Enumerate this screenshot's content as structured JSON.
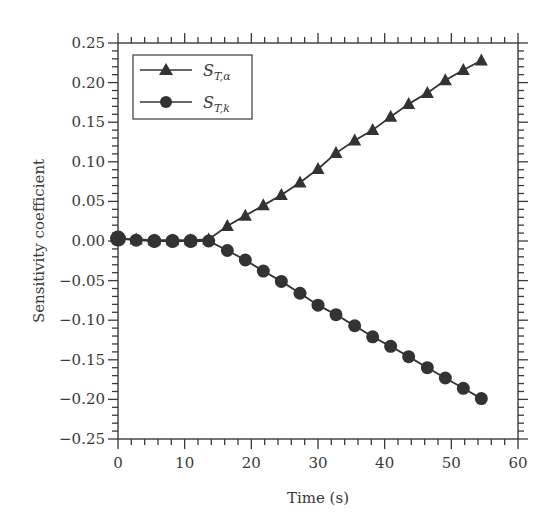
{
  "chart_data": {
    "type": "line",
    "title": "",
    "xlabel": "Time (s)",
    "ylabel": "Sensitivity coefficient",
    "xlim": [
      0,
      60
    ],
    "ylim": [
      -0.25,
      0.25
    ],
    "xticks": [
      0,
      10,
      20,
      30,
      40,
      50,
      60
    ],
    "xtick_labels": [
      "0",
      "10",
      "20",
      "30",
      "40",
      "50",
      "60"
    ],
    "yticks": [
      -0.25,
      -0.2,
      -0.15,
      -0.1,
      -0.05,
      0.0,
      0.05,
      0.1,
      0.15,
      0.2,
      0.25
    ],
    "ytick_labels": [
      "−0.25",
      "−0.20",
      "−0.15",
      "−0.10",
      "−0.05",
      "0.00",
      "0.05",
      "0.10",
      "0.15",
      "0.20",
      "0.25"
    ],
    "grid": false,
    "legend_position": "upper left",
    "x": [
      0,
      2.73,
      5.45,
      8.18,
      10.9,
      13.6,
      16.4,
      19.1,
      21.8,
      24.5,
      27.3,
      30.0,
      32.7,
      35.5,
      38.2,
      40.9,
      43.6,
      46.4,
      49.1,
      51.8,
      54.5
    ],
    "series": [
      {
        "name": "S_{T,α}",
        "label_main": "S",
        "label_sub": "T,α",
        "marker": "triangle",
        "color": "#333333",
        "values": [
          0.003,
          0.002,
          0.001,
          0.001,
          0.001,
          0.002,
          0.019,
          0.032,
          0.045,
          0.058,
          0.074,
          0.091,
          0.111,
          0.127,
          0.14,
          0.157,
          0.173,
          0.187,
          0.203,
          0.216,
          0.228
        ]
      },
      {
        "name": "S_{T,k}",
        "label_main": "S",
        "label_sub": "T,k",
        "marker": "circle",
        "color": "#333333",
        "values": [
          0.003,
          0.001,
          0.0,
          0.0,
          0.0,
          0.0,
          -0.012,
          -0.024,
          -0.038,
          -0.051,
          -0.066,
          -0.081,
          -0.093,
          -0.107,
          -0.121,
          -0.133,
          -0.146,
          -0.16,
          -0.173,
          -0.186,
          -0.199
        ]
      }
    ]
  }
}
